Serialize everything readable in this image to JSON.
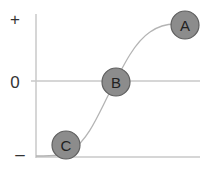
{
  "diagram": {
    "type": "sigmoid-curve-with-points",
    "y_axis_labels": {
      "top": "+",
      "middle": "0",
      "bottom": "–"
    },
    "points": [
      {
        "id": "A",
        "label": "A",
        "position": "top-right, plateau high"
      },
      {
        "id": "B",
        "label": "B",
        "position": "middle, crosses zero line"
      },
      {
        "id": "C",
        "label": "C",
        "position": "bottom-left, plateau low"
      }
    ],
    "colors": {
      "axis": "#c8c8c8",
      "curve": "#b4b4b4",
      "node_fill": "#8c8c8c",
      "node_stroke": "#5f5f5f",
      "label_text": "#333333"
    }
  }
}
